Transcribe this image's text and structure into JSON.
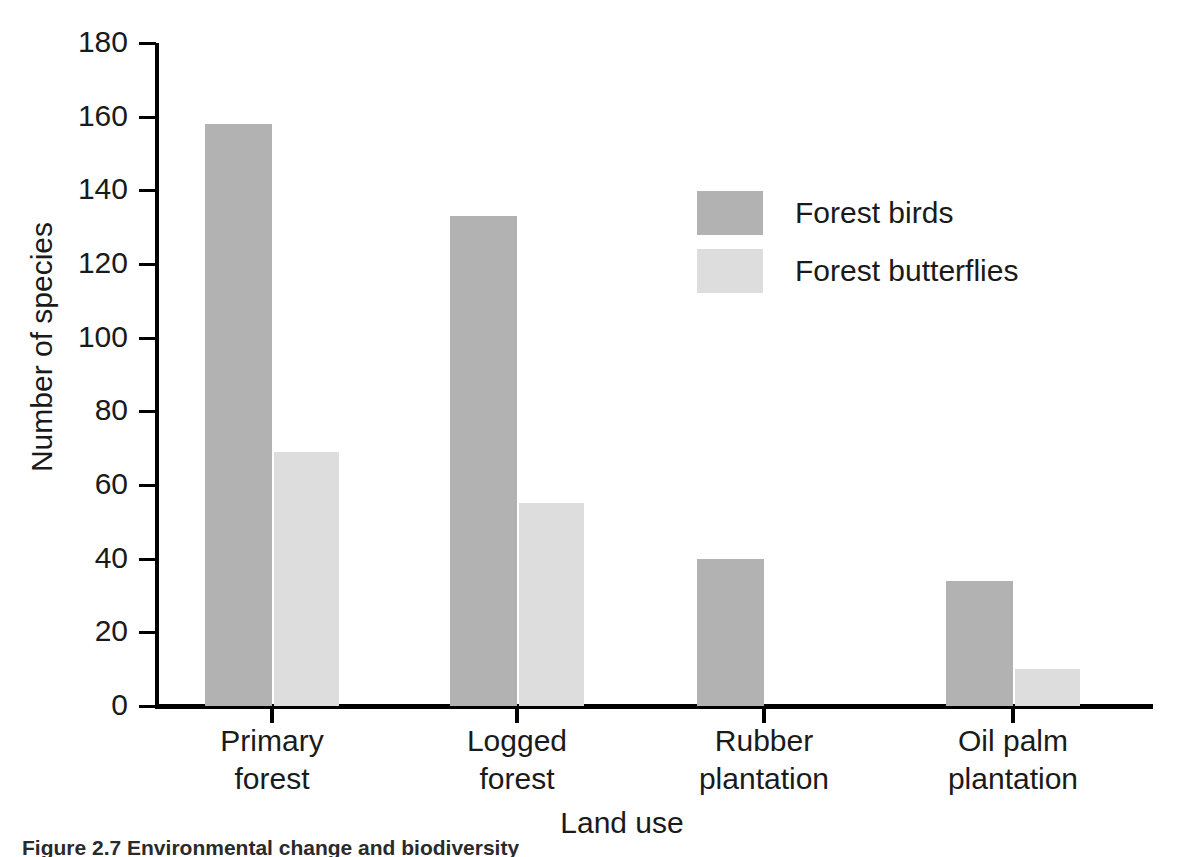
{
  "chart_data": {
    "type": "bar",
    "title": "",
    "xlabel": "Land use",
    "ylabel": "Number of species",
    "categories": [
      "Primary forest",
      "Logged forest",
      "Rubber plantation",
      "Oil palm plantation"
    ],
    "category_lines": [
      [
        "Primary",
        "forest"
      ],
      [
        "Logged",
        "forest"
      ],
      [
        "Rubber",
        "plantation"
      ],
      [
        "Oil palm",
        "plantation"
      ]
    ],
    "series": [
      {
        "name": "Forest birds",
        "values": [
          158,
          133,
          40,
          34
        ],
        "color": "#b2b2b2"
      },
      {
        "name": "Forest butterflies",
        "values": [
          69,
          55,
          0,
          10
        ],
        "color": "#dddddd"
      }
    ],
    "ylim": [
      0,
      180
    ],
    "yticks": [
      180,
      160,
      140,
      120,
      100,
      80,
      60,
      40,
      20,
      0
    ],
    "ytick_labels": [
      "180",
      "160",
      "140",
      "120",
      "100",
      "80",
      "60",
      "40",
      "20",
      "0"
    ],
    "grid": false,
    "legend_position": "upper-right-inside"
  },
  "legend": {
    "entries": [
      {
        "label": "Forest birds",
        "color": "#b2b2b2"
      },
      {
        "label": "Forest butterflies",
        "color": "#dddddd"
      }
    ]
  },
  "caption": {
    "text": "Figure 2.7 Environmental change and biodiversity"
  }
}
